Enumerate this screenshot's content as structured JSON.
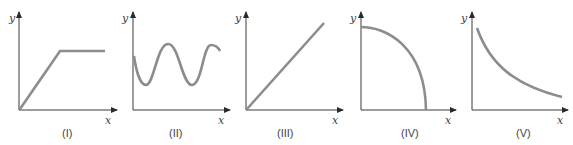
{
  "figure": {
    "panels": [
      {
        "id": "I",
        "label": "(I)",
        "x_axis": "x",
        "y_axis": "y",
        "shape": "linear-rise-then-plateau"
      },
      {
        "id": "II",
        "label": "(II)",
        "x_axis": "x",
        "y_axis": "y",
        "shape": "sinusoidal-oscillation"
      },
      {
        "id": "III",
        "label": "(III)",
        "x_axis": "x",
        "y_axis": "y",
        "shape": "straight-line-through-origin"
      },
      {
        "id": "IV",
        "label": "(IV)",
        "x_axis": "x",
        "y_axis": "y",
        "shape": "concave-down-quarter-arc"
      },
      {
        "id": "V",
        "label": "(V)",
        "x_axis": "x",
        "y_axis": "y",
        "shape": "decreasing-decay-curve"
      }
    ],
    "colors": {
      "axis": "#3a3a3a",
      "curve": "#8c8c8c",
      "text": "#444444"
    }
  }
}
